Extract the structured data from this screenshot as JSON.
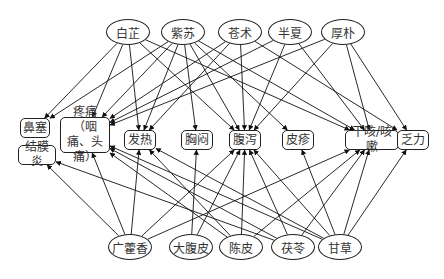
{
  "diagram": {
    "type": "herb-symptom directed graph",
    "top_herbs": [
      {
        "id": "baizhi",
        "label": "白芷",
        "x": 128,
        "y": 32
      },
      {
        "id": "zisu",
        "label": "紫苏",
        "x": 183,
        "y": 32
      },
      {
        "id": "cangzhu",
        "label": "苍术",
        "x": 240,
        "y": 32
      },
      {
        "id": "banxia",
        "label": "半夏",
        "x": 290,
        "y": 32
      },
      {
        "id": "houpo",
        "label": "厚朴",
        "x": 343,
        "y": 32
      }
    ],
    "bottom_herbs": [
      {
        "id": "guanghuoxiang",
        "label": "广藿香",
        "x": 130,
        "y": 247
      },
      {
        "id": "dafupi",
        "label": "大腹皮",
        "x": 191,
        "y": 247
      },
      {
        "id": "chenpi",
        "label": "陈皮",
        "x": 241,
        "y": 247
      },
      {
        "id": "fuling",
        "label": "茯苓",
        "x": 293,
        "y": 247
      },
      {
        "id": "gancao",
        "label": "甘草",
        "x": 340,
        "y": 247
      }
    ],
    "symptoms": [
      {
        "id": "bisai",
        "label": "鼻塞",
        "x": 35,
        "y": 128,
        "w": 30,
        "h": 20
      },
      {
        "id": "jiemoyan",
        "label": "结膜炎",
        "x": 37,
        "y": 155,
        "w": 38,
        "h": 20
      },
      {
        "id": "tengtong",
        "label": "疼痛（咽痛、头痛）",
        "x": 85,
        "y": 135,
        "w": 50,
        "h": 36
      },
      {
        "id": "fare",
        "label": "发热",
        "x": 140,
        "y": 140,
        "w": 32,
        "h": 20
      },
      {
        "id": "xiongmen",
        "label": "胸闷",
        "x": 197,
        "y": 140,
        "w": 32,
        "h": 20
      },
      {
        "id": "fuxie",
        "label": "腹泻",
        "x": 245,
        "y": 140,
        "w": 32,
        "h": 20
      },
      {
        "id": "pizhen",
        "label": "皮疹",
        "x": 298,
        "y": 140,
        "w": 32,
        "h": 20
      },
      {
        "id": "gankesou",
        "label": "干咳/咳嗽",
        "x": 372,
        "y": 140,
        "w": 54,
        "h": 20
      },
      {
        "id": "fali",
        "label": "乏力",
        "x": 413,
        "y": 140,
        "w": 32,
        "h": 20
      }
    ],
    "edges": [
      [
        "baizhi",
        "bisai"
      ],
      [
        "baizhi",
        "tengtong"
      ],
      [
        "baizhi",
        "fare"
      ],
      [
        "baizhi",
        "fuxie"
      ],
      [
        "baizhi",
        "gankesou"
      ],
      [
        "zisu",
        "tengtong"
      ],
      [
        "zisu",
        "fare"
      ],
      [
        "zisu",
        "xiongmen"
      ],
      [
        "zisu",
        "fuxie"
      ],
      [
        "zisu",
        "pizhen"
      ],
      [
        "zisu",
        "gankesou"
      ],
      [
        "zisu",
        "bisai"
      ],
      [
        "cangzhu",
        "tengtong"
      ],
      [
        "cangzhu",
        "fuxie"
      ],
      [
        "cangzhu",
        "fali"
      ],
      [
        "cangzhu",
        "fare"
      ],
      [
        "banxia",
        "tengtong"
      ],
      [
        "banxia",
        "fuxie"
      ],
      [
        "banxia",
        "gankesou"
      ],
      [
        "houpo",
        "fuxie"
      ],
      [
        "houpo",
        "gankesou"
      ],
      [
        "houpo",
        "fali"
      ],
      [
        "houpo",
        "tengtong"
      ],
      [
        "guanghuoxiang",
        "jiemoyan"
      ],
      [
        "guanghuoxiang",
        "tengtong"
      ],
      [
        "guanghuoxiang",
        "fare"
      ],
      [
        "guanghuoxiang",
        "fuxie"
      ],
      [
        "guanghuoxiang",
        "gankesou"
      ],
      [
        "dafupi",
        "xiongmen"
      ],
      [
        "dafupi",
        "fuxie"
      ],
      [
        "chenpi",
        "fuxie"
      ],
      [
        "chenpi",
        "tengtong"
      ],
      [
        "chenpi",
        "gankesou"
      ],
      [
        "chenpi",
        "fare"
      ],
      [
        "fuling",
        "fuxie"
      ],
      [
        "fuling",
        "gankesou"
      ],
      [
        "fuling",
        "tengtong"
      ],
      [
        "fuling",
        "jiemoyan"
      ],
      [
        "gancao",
        "fuxie"
      ],
      [
        "gancao",
        "pizhen"
      ],
      [
        "gancao",
        "gankesou"
      ],
      [
        "gancao",
        "fali"
      ],
      [
        "gancao",
        "tengtong"
      ],
      [
        "gancao",
        "fare"
      ]
    ]
  }
}
